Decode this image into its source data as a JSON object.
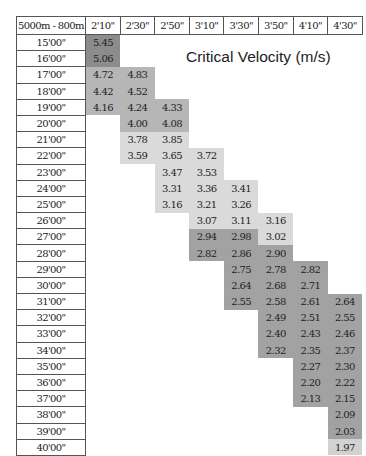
{
  "title": "Critical Velocity  (m/s)",
  "corner_label": "5000m - 800m",
  "columns": [
    "2'10\"",
    "2'30\"",
    "2'50\"",
    "3'10\"",
    "3'30\"",
    "3'50\"",
    "4'10\"",
    "4'30\""
  ],
  "rows": [
    {
      "label": "15'00\"",
      "cells": [
        "5.45",
        "",
        "",
        "",
        "",
        "",
        "",
        ""
      ],
      "shade": [
        "dark",
        "",
        "",
        "",
        "",
        "",
        "",
        ""
      ]
    },
    {
      "label": "16'00\"",
      "cells": [
        "5.06",
        "",
        "",
        "",
        "",
        "",
        "",
        ""
      ],
      "shade": [
        "dark",
        "",
        "",
        "",
        "",
        "",
        "",
        ""
      ]
    },
    {
      "label": "17'00\"",
      "cells": [
        "4.72",
        "4.83",
        "",
        "",
        "",
        "",
        "",
        ""
      ],
      "shade": [
        "med",
        "med",
        "",
        "",
        "",
        "",
        "",
        ""
      ]
    },
    {
      "label": "18'00\"",
      "cells": [
        "4.42",
        "4.52",
        "",
        "",
        "",
        "",
        "",
        ""
      ],
      "shade": [
        "med",
        "med",
        "",
        "",
        "",
        "",
        "",
        ""
      ]
    },
    {
      "label": "19'00\"",
      "cells": [
        "4.16",
        "4.24",
        "4.33",
        "",
        "",
        "",
        "",
        ""
      ],
      "shade": [
        "med",
        "med",
        "med",
        "",
        "",
        "",
        "",
        ""
      ]
    },
    {
      "label": "20'00\"",
      "cells": [
        "",
        "4.00",
        "4.08",
        "",
        "",
        "",
        "",
        ""
      ],
      "shade": [
        "",
        "med",
        "med",
        "",
        "",
        "",
        "",
        ""
      ]
    },
    {
      "label": "21'00\"",
      "cells": [
        "",
        "3.78",
        "3.85",
        "",
        "",
        "",
        "",
        ""
      ],
      "shade": [
        "",
        "light",
        "light",
        "",
        "",
        "",
        "",
        ""
      ]
    },
    {
      "label": "22'00\"",
      "cells": [
        "",
        "3.59",
        "3.65",
        "3.72",
        "",
        "",
        "",
        ""
      ],
      "shade": [
        "",
        "light",
        "light",
        "light",
        "",
        "",
        "",
        ""
      ]
    },
    {
      "label": "23'00\"",
      "cells": [
        "",
        "",
        "3.47",
        "3.53",
        "",
        "",
        "",
        ""
      ],
      "shade": [
        "",
        "",
        "light",
        "light",
        "",
        "",
        "",
        ""
      ]
    },
    {
      "label": "24'00\"",
      "cells": [
        "",
        "",
        "3.31",
        "3.36",
        "3.41",
        "",
        "",
        ""
      ],
      "shade": [
        "",
        "",
        "light",
        "light",
        "light",
        "",
        "",
        ""
      ]
    },
    {
      "label": "25'00\"",
      "cells": [
        "",
        "",
        "3.16",
        "3.21",
        "3.26",
        "",
        "",
        ""
      ],
      "shade": [
        "",
        "",
        "light",
        "light",
        "light",
        "",
        "",
        ""
      ]
    },
    {
      "label": "26'00\"",
      "cells": [
        "",
        "",
        "",
        "3.07",
        "3.11",
        "3.16",
        "",
        ""
      ],
      "shade": [
        "",
        "",
        "",
        "light",
        "light",
        "light",
        "",
        ""
      ]
    },
    {
      "label": "27'00\"",
      "cells": [
        "",
        "",
        "",
        "2.94",
        "2.98",
        "3.02",
        "",
        ""
      ],
      "shade": [
        "",
        "",
        "",
        "mdark",
        "mdark",
        "light",
        "",
        ""
      ]
    },
    {
      "label": "28'00\"",
      "cells": [
        "",
        "",
        "",
        "2.82",
        "2.86",
        "2.90",
        "",
        ""
      ],
      "shade": [
        "",
        "",
        "",
        "mdark",
        "mdark",
        "mdark",
        "",
        ""
      ]
    },
    {
      "label": "29'00\"",
      "cells": [
        "",
        "",
        "",
        "",
        "2.75",
        "2.78",
        "2.82",
        ""
      ],
      "shade": [
        "",
        "",
        "",
        "",
        "mdark",
        "mdark",
        "mdark",
        ""
      ]
    },
    {
      "label": "30'00\"",
      "cells": [
        "",
        "",
        "",
        "",
        "2.64",
        "2.68",
        "2.71",
        ""
      ],
      "shade": [
        "",
        "",
        "",
        "",
        "mdark",
        "mdark",
        "mdark",
        ""
      ]
    },
    {
      "label": "31'00\"",
      "cells": [
        "",
        "",
        "",
        "",
        "2.55",
        "2.58",
        "2.61",
        "2.64"
      ],
      "shade": [
        "",
        "",
        "",
        "",
        "mdark",
        "mdark",
        "mdark",
        "mdark"
      ]
    },
    {
      "label": "32'00\"",
      "cells": [
        "",
        "",
        "",
        "",
        "",
        "2.49",
        "2.51",
        "2.55"
      ],
      "shade": [
        "",
        "",
        "",
        "",
        "",
        "mdark",
        "mdark",
        "mdark"
      ]
    },
    {
      "label": "33'00\"",
      "cells": [
        "",
        "",
        "",
        "",
        "",
        "2.40",
        "2.43",
        "2.46"
      ],
      "shade": [
        "",
        "",
        "",
        "",
        "",
        "mdark",
        "mdark",
        "mdark"
      ]
    },
    {
      "label": "34'00\"",
      "cells": [
        "",
        "",
        "",
        "",
        "",
        "2.32",
        "2.35",
        "2.37"
      ],
      "shade": [
        "",
        "",
        "",
        "",
        "",
        "mdark",
        "mdark",
        "mdark"
      ]
    },
    {
      "label": "35'00\"",
      "cells": [
        "",
        "",
        "",
        "",
        "",
        "",
        "2.27",
        "2.30"
      ],
      "shade": [
        "",
        "",
        "",
        "",
        "",
        "",
        "mdark",
        "mdark"
      ]
    },
    {
      "label": "36'00\"",
      "cells": [
        "",
        "",
        "",
        "",
        "",
        "",
        "2.20",
        "2.22"
      ],
      "shade": [
        "",
        "",
        "",
        "",
        "",
        "",
        "mdark",
        "mdark"
      ]
    },
    {
      "label": "37'00\"",
      "cells": [
        "",
        "",
        "",
        "",
        "",
        "",
        "2.13",
        "2.15"
      ],
      "shade": [
        "",
        "",
        "",
        "",
        "",
        "",
        "mdark",
        "mdark"
      ]
    },
    {
      "label": "38'00\"",
      "cells": [
        "",
        "",
        "",
        "",
        "",
        "",
        "",
        "2.09"
      ],
      "shade": [
        "",
        "",
        "",
        "",
        "",
        "",
        "",
        "mdark"
      ]
    },
    {
      "label": "39'00\"",
      "cells": [
        "",
        "",
        "",
        "",
        "",
        "",
        "",
        "2.03"
      ],
      "shade": [
        "",
        "",
        "",
        "",
        "",
        "",
        "",
        "mdark"
      ]
    },
    {
      "label": "40'00\"",
      "cells": [
        "",
        "",
        "",
        "",
        "",
        "",
        "",
        "1.97"
      ],
      "shade": [
        "",
        "",
        "",
        "",
        "",
        "",
        "",
        "pale"
      ]
    }
  ],
  "colors": {
    "dark": "#8c8c8c",
    "med": "#b6b6b6",
    "light": "#dadada",
    "mdark": "#a2a2a2",
    "pale": "#d2d2d2"
  },
  "chart_data": {
    "type": "table",
    "title": "Critical Velocity (m/s)",
    "row_header": "5000m - 800m",
    "columns": [
      "2'10\"",
      "2'30\"",
      "2'50\"",
      "3'10\"",
      "3'30\"",
      "3'50\"",
      "4'10\"",
      "4'30\""
    ],
    "row_labels": [
      "15'00\"",
      "16'00\"",
      "17'00\"",
      "18'00\"",
      "19'00\"",
      "20'00\"",
      "21'00\"",
      "22'00\"",
      "23'00\"",
      "24'00\"",
      "25'00\"",
      "26'00\"",
      "27'00\"",
      "28'00\"",
      "29'00\"",
      "30'00\"",
      "31'00\"",
      "32'00\"",
      "33'00\"",
      "34'00\"",
      "35'00\"",
      "36'00\"",
      "37'00\"",
      "38'00\"",
      "39'00\"",
      "40'00\""
    ],
    "values": [
      [
        5.45,
        null,
        null,
        null,
        null,
        null,
        null,
        null
      ],
      [
        5.06,
        null,
        null,
        null,
        null,
        null,
        null,
        null
      ],
      [
        4.72,
        4.83,
        null,
        null,
        null,
        null,
        null,
        null
      ],
      [
        4.42,
        4.52,
        null,
        null,
        null,
        null,
        null,
        null
      ],
      [
        4.16,
        4.24,
        4.33,
        null,
        null,
        null,
        null,
        null
      ],
      [
        null,
        4.0,
        4.08,
        null,
        null,
        null,
        null,
        null
      ],
      [
        null,
        3.78,
        3.85,
        null,
        null,
        null,
        null,
        null
      ],
      [
        null,
        3.59,
        3.65,
        3.72,
        null,
        null,
        null,
        null
      ],
      [
        null,
        null,
        3.47,
        3.53,
        null,
        null,
        null,
        null
      ],
      [
        null,
        null,
        3.31,
        3.36,
        3.41,
        null,
        null,
        null
      ],
      [
        null,
        null,
        3.16,
        3.21,
        3.26,
        null,
        null,
        null
      ],
      [
        null,
        null,
        null,
        3.07,
        3.11,
        3.16,
        null,
        null
      ],
      [
        null,
        null,
        null,
        2.94,
        2.98,
        3.02,
        null,
        null
      ],
      [
        null,
        null,
        null,
        2.82,
        2.86,
        2.9,
        null,
        null
      ],
      [
        null,
        null,
        null,
        null,
        2.75,
        2.78,
        2.82,
        null
      ],
      [
        null,
        null,
        null,
        null,
        2.64,
        2.68,
        2.71,
        null
      ],
      [
        null,
        null,
        null,
        null,
        2.55,
        2.58,
        2.61,
        2.64
      ],
      [
        null,
        null,
        null,
        null,
        null,
        2.49,
        2.51,
        2.55
      ],
      [
        null,
        null,
        null,
        null,
        null,
        2.4,
        2.43,
        2.46
      ],
      [
        null,
        null,
        null,
        null,
        null,
        2.32,
        2.35,
        2.37
      ],
      [
        null,
        null,
        null,
        null,
        null,
        null,
        2.27,
        2.3
      ],
      [
        null,
        null,
        null,
        null,
        null,
        null,
        2.2,
        2.22
      ],
      [
        null,
        null,
        null,
        null,
        null,
        null,
        2.13,
        2.15
      ],
      [
        null,
        null,
        null,
        null,
        null,
        null,
        null,
        2.09
      ],
      [
        null,
        null,
        null,
        null,
        null,
        null,
        null,
        2.03
      ],
      [
        null,
        null,
        null,
        null,
        null,
        null,
        null,
        1.97
      ]
    ]
  }
}
